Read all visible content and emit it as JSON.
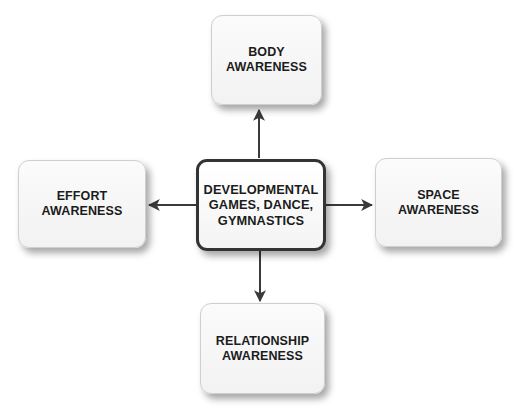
{
  "diagram": {
    "type": "hub-and-spoke",
    "center": {
      "lines": [
        "DEVELOPMENTAL",
        "GAMES, DANCE,",
        "GYMNASTICS"
      ]
    },
    "nodes": {
      "top": {
        "lines": [
          "BODY",
          "AWARENESS"
        ]
      },
      "left": {
        "lines": [
          "EFFORT",
          "AWARENESS"
        ]
      },
      "right": {
        "lines": [
          "SPACE",
          "AWARENESS"
        ]
      },
      "bottom": {
        "lines": [
          "RELATIONSHIP",
          "AWARENESS"
        ]
      }
    },
    "edges": [
      {
        "from": "center",
        "to": "top",
        "direction": "up"
      },
      {
        "from": "center",
        "to": "left",
        "direction": "left"
      },
      {
        "from": "center",
        "to": "right",
        "direction": "right"
      },
      {
        "from": "center",
        "to": "bottom",
        "direction": "down"
      }
    ],
    "colors": {
      "arrow": "#3a3a3a",
      "center_border": "#333333",
      "box_fill": "#f6f6f6",
      "text": "#1c1c1c"
    }
  }
}
